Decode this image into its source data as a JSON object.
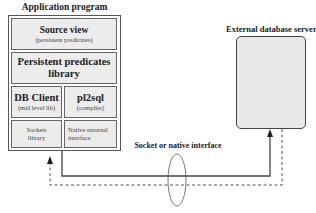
{
  "app_box": {
    "title": "Application program",
    "source_view": {
      "title": "Source view",
      "subtitle": "(persistent predicates)"
    },
    "persistent_lib": {
      "line1": "Persistent predicates",
      "line2": "library"
    },
    "db_client": {
      "title": "DB Client",
      "subtitle": "(mid level lib)"
    },
    "pl2sql": {
      "title": "pl2sql",
      "subtitle": "(compiler)"
    },
    "sockets": {
      "line1": "Sockets",
      "line2": "library"
    },
    "native": {
      "line1": "Native external",
      "line2": "interface"
    }
  },
  "server_box": {
    "title": "External database server"
  },
  "connection": {
    "label": "Socket or native interface"
  },
  "colors": {
    "box_fill": "#ececec",
    "server_fill": "#e8e8e8",
    "line": "#444444"
  }
}
